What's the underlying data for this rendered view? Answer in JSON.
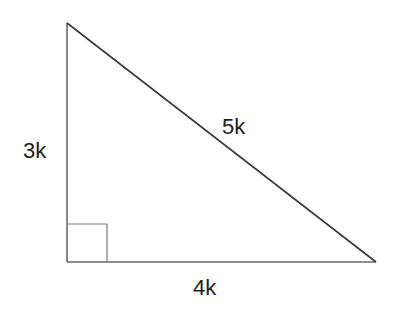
{
  "diagram": {
    "type": "right-triangle",
    "stroke_color": "#555555",
    "vertices": {
      "top": [
        67,
        23
      ],
      "right_angle": [
        67,
        262
      ],
      "bottom_right": [
        376,
        262
      ]
    },
    "right_angle_marker": {
      "x": 67,
      "y": 224,
      "size": 39
    },
    "labels": {
      "vertical_side": "3k",
      "hypotenuse": "5k",
      "horizontal_side": "4k"
    }
  }
}
